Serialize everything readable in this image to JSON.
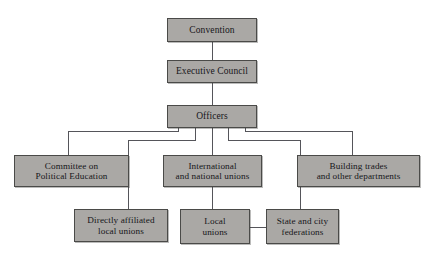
{
  "diagram": {
    "type": "organization-chart",
    "orientation": "top-down",
    "palette": {
      "node_fill": "#aaa8a5",
      "node_border": "#4a4a48",
      "connector": "#55555a",
      "background": "#ffffff",
      "text": "#16161a"
    },
    "nodes": [
      {
        "id": "convention",
        "label": "Convention",
        "level": 1
      },
      {
        "id": "exec_council",
        "label": "Executive Council",
        "level": 2
      },
      {
        "id": "officers",
        "label": "Officers",
        "level": 3
      },
      {
        "id": "cope",
        "label": "Committee on\nPolitical Education",
        "level": 4
      },
      {
        "id": "intl_natl",
        "label": "International\nand national unions",
        "level": 4
      },
      {
        "id": "building_trades",
        "label": "Building trades\nand other departments",
        "level": 4
      },
      {
        "id": "directly_aff",
        "label": "Directly affiliated\nlocal unions",
        "level": 5
      },
      {
        "id": "local_unions",
        "label": "Local\nunions",
        "level": 5
      },
      {
        "id": "state_city",
        "label": "State and city\nfederations",
        "level": 5
      }
    ],
    "edges": [
      {
        "from": "convention",
        "to": "exec_council"
      },
      {
        "from": "exec_council",
        "to": "officers"
      },
      {
        "from": "officers",
        "to": "cope"
      },
      {
        "from": "officers",
        "to": "directly_aff"
      },
      {
        "from": "officers",
        "to": "intl_natl"
      },
      {
        "from": "officers",
        "to": "state_city"
      },
      {
        "from": "officers",
        "to": "building_trades"
      },
      {
        "from": "intl_natl",
        "to": "local_unions"
      },
      {
        "from": "local_unions",
        "to": "state_city"
      }
    ]
  }
}
